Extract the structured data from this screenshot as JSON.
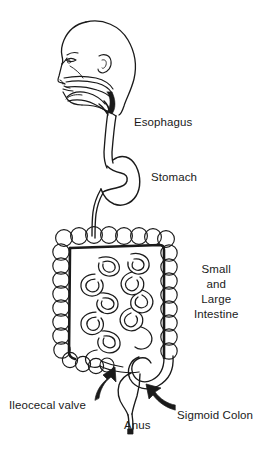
{
  "figure": {
    "background_color": "#ffffff",
    "ink_color": "#1a1a1a",
    "width": 274,
    "height": 451
  },
  "labels": {
    "esophagus": "Esophagus",
    "stomach": "Stomach",
    "intestine_line1": "Small",
    "intestine_line2": "and",
    "intestine_line3": "Large",
    "intestine_line4": "Intestine",
    "ileocecal_valve": "Ileocecal valve",
    "anus": "Anus",
    "sigmoid_colon": "Sigmoid Colon"
  },
  "structures": {
    "head": "head-profile-facing-left",
    "nasal_cavity": "nasal-cavity",
    "oral_cavity": "oral-cavity-with-tongue",
    "pharynx": "pharynx",
    "esophagus": "esophagus-tube",
    "stomach": "stomach",
    "duodenum": "duodenum",
    "large_intestine": "large-intestine-haustra-frame",
    "small_intestine": "small-intestine-coils",
    "cecum": "cecum",
    "sigmoid_colon": "sigmoid-colon",
    "rectum": "rectum",
    "anus": "anus"
  },
  "annotations": {
    "arrow_ileocecal": "arrow-pointing-up-right-to-ileocecal-valve",
    "arrow_sigmoid": "arrow-pointing-up-left-to-sigmoid-colon"
  }
}
